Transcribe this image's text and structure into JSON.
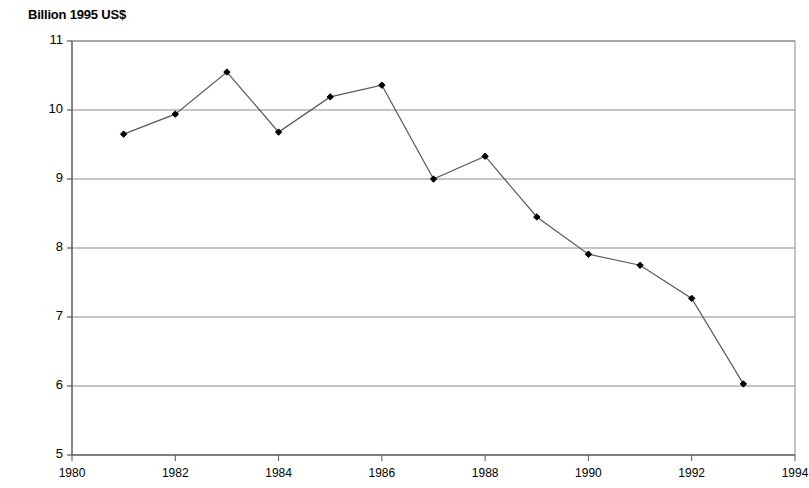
{
  "chart_data": {
    "type": "line",
    "title": "Billion 1995 US$",
    "xlabel": "",
    "ylabel": "",
    "grid": true,
    "legend": false,
    "xlim": [
      1980,
      1994
    ],
    "ylim": [
      5,
      11
    ],
    "y_ticks": [
      11,
      10,
      9,
      8,
      7,
      6,
      5
    ],
    "y_tick_labels": [
      "11",
      "10",
      "9",
      "8",
      "7",
      "6",
      "5"
    ],
    "x_ticks": [
      1980,
      1982,
      1984,
      1986,
      1988,
      1990,
      1992,
      1994
    ],
    "x_tick_labels": [
      "1980",
      "1982",
      "1984",
      "1986",
      "1988",
      "1990",
      "1992",
      "1994"
    ],
    "x": [
      1981,
      1982,
      1983,
      1984,
      1985,
      1986,
      1987,
      1988,
      1989,
      1990,
      1991,
      1992,
      1993
    ],
    "values": [
      9.65,
      9.94,
      10.55,
      9.68,
      10.19,
      10.36,
      9.0,
      9.33,
      8.45,
      7.91,
      7.75,
      7.27,
      6.03
    ],
    "series": [
      {
        "name": "Billion 1995 US$",
        "x": [
          1981,
          1982,
          1983,
          1984,
          1985,
          1986,
          1987,
          1988,
          1989,
          1990,
          1991,
          1992,
          1993
        ],
        "values": [
          9.65,
          9.94,
          10.55,
          9.68,
          10.19,
          10.36,
          9.0,
          9.33,
          8.45,
          7.91,
          7.75,
          7.27,
          6.03
        ],
        "marker": "diamond",
        "line_color": "#595959",
        "marker_color": "#000000"
      }
    ],
    "colors": {
      "line": "#595959",
      "marker": "#000000",
      "grid": "#8c8c8c",
      "axis": "#595959",
      "background": "#ffffff",
      "text": "#000000"
    }
  }
}
